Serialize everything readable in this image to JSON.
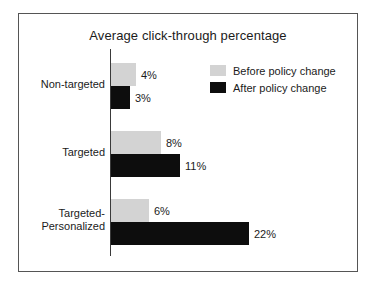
{
  "chart_data": {
    "type": "bar",
    "orientation": "horizontal",
    "title": "Average click-through percentage",
    "xlabel": "",
    "ylabel": "",
    "categories": [
      "Non-targeted",
      "Targeted",
      "Targeted-Personalized"
    ],
    "category_display": [
      [
        "Non-targeted"
      ],
      [
        "Targeted"
      ],
      [
        "Targeted-",
        "Personalized"
      ]
    ],
    "series": [
      {
        "name": "Before policy change",
        "color": "#d3d3d3",
        "values": [
          4,
          8,
          6
        ],
        "labels": [
          "4%",
          "8%",
          "6%"
        ]
      },
      {
        "name": "After policy change",
        "color": "#0d0d0d",
        "values": [
          3,
          11,
          22
        ],
        "labels": [
          "3%",
          "11%",
          "22%"
        ]
      }
    ],
    "value_unit": "%",
    "xlim": [
      0,
      22
    ],
    "grid": false,
    "legend_position": "top-right",
    "px_per_unit": 6.27
  },
  "legend": {
    "entries": [
      {
        "label": "Before policy change",
        "swatch": "before"
      },
      {
        "label": "After policy change",
        "swatch": "after"
      }
    ]
  }
}
